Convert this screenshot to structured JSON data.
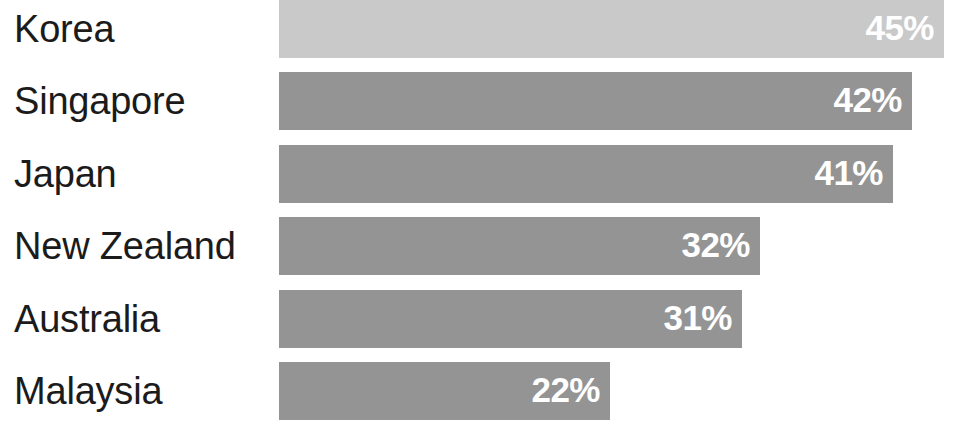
{
  "chart_data": {
    "type": "bar",
    "orientation": "horizontal",
    "title": "",
    "subtitle": "",
    "xlabel": "",
    "ylabel": "",
    "grid": false,
    "legend": false,
    "axis_visible": false,
    "xlim": [
      0,
      45
    ],
    "categories": [
      "Korea",
      "Singapore",
      "Japan",
      "New Zealand",
      "Australia",
      "Malaysia"
    ],
    "values": [
      45,
      42,
      41,
      32,
      31,
      22
    ],
    "value_labels": [
      "45%",
      "42%",
      "41%",
      "32%",
      "31%",
      "22%"
    ],
    "value_label_position": "inside-end",
    "bar_colors": [
      "#c9c9c9",
      "#949494",
      "#949494",
      "#949494",
      "#949494",
      "#949494"
    ],
    "value_label_color": "#ffffff",
    "category_label_color": "#1b1b1b",
    "background_color": "#ffffff"
  },
  "layout": {
    "plot_left": 279,
    "bar_height": 58,
    "row_pitch": 72.4,
    "px_per_unit": 14.78,
    "row_tops": [
      0,
      72,
      145,
      217,
      290,
      362
    ]
  },
  "bars": [
    {
      "label": "Korea",
      "value": 45,
      "value_label": "45%",
      "color": "#c9c9c9",
      "top": 0,
      "width": 665
    },
    {
      "label": "Singapore",
      "value": 42,
      "value_label": "42%",
      "color": "#949494",
      "top": 72,
      "width": 633
    },
    {
      "label": "Japan",
      "value": 41,
      "value_label": "41%",
      "color": "#949494",
      "top": 145,
      "width": 614
    },
    {
      "label": "New Zealand",
      "value": 32,
      "value_label": "32%",
      "color": "#949494",
      "top": 217,
      "width": 481
    },
    {
      "label": "Australia",
      "value": 31,
      "value_label": "31%",
      "color": "#949494",
      "top": 290,
      "width": 463
    },
    {
      "label": "Malaysia",
      "value": 22,
      "value_label": "22%",
      "color": "#949494",
      "top": 362,
      "width": 331
    }
  ]
}
